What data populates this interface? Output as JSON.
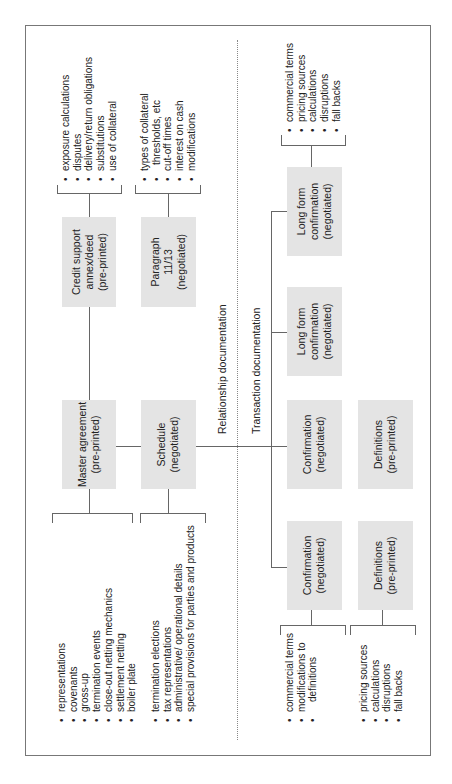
{
  "sections": {
    "relationship": "Relationship documentation",
    "transaction": "Transaction documentation"
  },
  "boxes": {
    "master": {
      "title": "Master agreement",
      "sub": "(pre-printed)"
    },
    "schedule": {
      "title": "Schedule",
      "sub": "(negotiated)"
    },
    "credit": {
      "line1": "Credit support",
      "line2": "annex/deed",
      "sub": "(pre-printed)"
    },
    "paragraph": {
      "line1": "Paragraph",
      "line2": "11/13",
      "sub": "(negotiated)"
    },
    "confirmation_a": {
      "title": "Confirmation",
      "sub": "(negotiated)"
    },
    "definitions_a": {
      "title": "Definitions",
      "sub": "(pre-printed)"
    },
    "longform_a": {
      "line1": "Long form",
      "line2": "confirmation",
      "sub": "(negotiated)"
    },
    "longform_b": {
      "line1": "Long form",
      "line2": "confirmation",
      "sub": "(negotiated)"
    },
    "confirmation_b": {
      "title": "Confirmation",
      "sub": "(negotiated)"
    },
    "definitions_b": {
      "title": "Definitions",
      "sub": "(pre-printed)"
    }
  },
  "lists": {
    "master": [
      "representations",
      "covenants",
      "gross-up",
      "termination events",
      "close-out netting mechanics",
      "settlement netting",
      "boiler plate"
    ],
    "schedule": [
      "termination elections",
      "tax representations",
      "administrative/ operational details",
      "special provisions for parties and products"
    ],
    "credit": [
      "exposure calculations",
      "disputes",
      "delivery/return obligations",
      "substitutions",
      "use of collateral"
    ],
    "paragraph": [
      "types of  collateral",
      "  thresholds, etc",
      "cut-off times",
      "interest on cash",
      "modifications"
    ],
    "longform": [
      "commercial terms",
      "pricing sources",
      "calculations",
      "disruptions",
      "fall backs"
    ],
    "confirmation": [
      "commercial terms",
      "modifications to",
      "  definitions"
    ],
    "definitions": [
      "pricing sources",
      "calculations",
      "disruptions",
      "fall backs"
    ]
  }
}
